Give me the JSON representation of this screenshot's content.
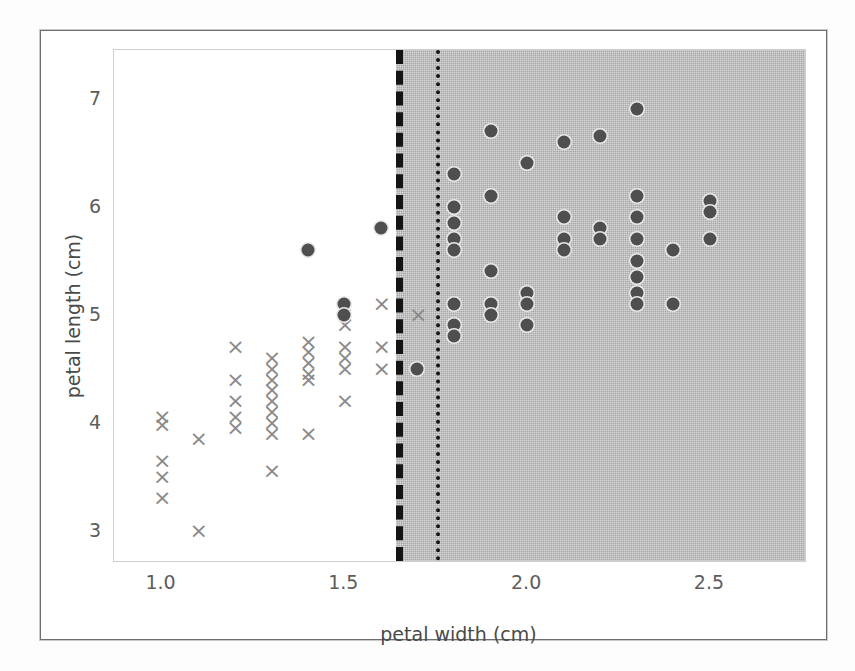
{
  "figure": {
    "xlabel": "petal width (cm)",
    "ylabel": "petal length (cm)",
    "xticks": [
      "1.0",
      "1.5",
      "2.0",
      "2.5"
    ],
    "yticks": [
      "3",
      "4",
      "5",
      "6",
      "7"
    ]
  },
  "colors": {
    "shade_region": "#a6a6a6",
    "circle_marker": "#4f4f4f",
    "x_marker": "#8a8a8a",
    "boundary_line": "#141414",
    "axes_border": "#cfcfcf",
    "tick_label": "#5d5d5d",
    "axis_label": "#4a4a4a",
    "page_background": "#ffffff"
  },
  "chart_data": {
    "type": "scatter",
    "title": "",
    "xlabel": "petal width (cm)",
    "ylabel": "petal length (cm)",
    "xlim": [
      0.87,
      2.76
    ],
    "ylim": [
      2.72,
      7.45
    ],
    "xticks": [
      1.0,
      1.5,
      2.0,
      2.5
    ],
    "yticks": [
      3,
      4,
      5,
      6,
      7
    ],
    "grid": false,
    "legend": "none",
    "decision_regions": [
      {
        "name": "left-region",
        "x_from": 0.87,
        "x_to": 1.64,
        "fill": "#ffffff"
      },
      {
        "name": "right-region",
        "x_from": 1.64,
        "x_to": 2.76,
        "fill": "#a6a6a6"
      }
    ],
    "boundaries": [
      {
        "name": "dashed-boundary",
        "x": 1.64,
        "style": "dashed",
        "width": 7
      },
      {
        "name": "dotted-boundary",
        "x": 1.75,
        "style": "dotted",
        "width": 4
      }
    ],
    "series": [
      {
        "name": "versicolor",
        "marker": "x",
        "color": "#8a8a8a",
        "points": [
          [
            1.0,
            4.05
          ],
          [
            1.0,
            3.98
          ],
          [
            1.0,
            3.65
          ],
          [
            1.0,
            3.5
          ],
          [
            1.0,
            3.3
          ],
          [
            1.1,
            3.85
          ],
          [
            1.1,
            3.0
          ],
          [
            1.2,
            4.7
          ],
          [
            1.2,
            4.4
          ],
          [
            1.2,
            4.2
          ],
          [
            1.2,
            4.05
          ],
          [
            1.2,
            3.95
          ],
          [
            1.3,
            4.6
          ],
          [
            1.3,
            4.5
          ],
          [
            1.3,
            4.4
          ],
          [
            1.3,
            4.3
          ],
          [
            1.3,
            4.2
          ],
          [
            1.3,
            4.1
          ],
          [
            1.3,
            4.0
          ],
          [
            1.3,
            3.9
          ],
          [
            1.3,
            3.55
          ],
          [
            1.4,
            4.75
          ],
          [
            1.4,
            4.65
          ],
          [
            1.4,
            4.55
          ],
          [
            1.4,
            4.45
          ],
          [
            1.4,
            4.4
          ],
          [
            1.4,
            3.9
          ],
          [
            1.5,
            5.0
          ],
          [
            1.5,
            4.9
          ],
          [
            1.5,
            4.7
          ],
          [
            1.5,
            4.6
          ],
          [
            1.5,
            4.5
          ],
          [
            1.5,
            4.2
          ],
          [
            1.6,
            5.1
          ],
          [
            1.6,
            4.7
          ],
          [
            1.6,
            4.5
          ],
          [
            1.7,
            5.0
          ]
        ]
      },
      {
        "name": "virginica",
        "marker": "o",
        "color": "#4f4f4f",
        "points": [
          [
            1.4,
            5.6
          ],
          [
            1.5,
            5.1
          ],
          [
            1.5,
            5.0
          ],
          [
            1.6,
            5.8
          ],
          [
            1.7,
            4.5
          ],
          [
            1.8,
            6.3
          ],
          [
            1.8,
            6.0
          ],
          [
            1.8,
            5.85
          ],
          [
            1.8,
            5.7
          ],
          [
            1.8,
            5.6
          ],
          [
            1.8,
            5.1
          ],
          [
            1.8,
            4.9
          ],
          [
            1.8,
            4.8
          ],
          [
            1.9,
            6.7
          ],
          [
            1.9,
            6.1
          ],
          [
            1.9,
            5.4
          ],
          [
            1.9,
            5.1
          ],
          [
            1.9,
            5.0
          ],
          [
            2.0,
            6.4
          ],
          [
            2.0,
            5.2
          ],
          [
            2.0,
            5.1
          ],
          [
            2.0,
            4.9
          ],
          [
            2.1,
            6.6
          ],
          [
            2.1,
            5.9
          ],
          [
            2.1,
            5.7
          ],
          [
            2.1,
            5.6
          ],
          [
            2.2,
            6.65
          ],
          [
            2.2,
            5.8
          ],
          [
            2.2,
            5.7
          ],
          [
            2.3,
            6.9
          ],
          [
            2.3,
            6.1
          ],
          [
            2.3,
            5.9
          ],
          [
            2.3,
            5.7
          ],
          [
            2.3,
            5.5
          ],
          [
            2.3,
            5.35
          ],
          [
            2.3,
            5.2
          ],
          [
            2.3,
            5.1
          ],
          [
            2.4,
            5.6
          ],
          [
            2.4,
            5.1
          ],
          [
            2.5,
            6.05
          ],
          [
            2.5,
            5.95
          ],
          [
            2.5,
            5.7
          ]
        ]
      }
    ]
  }
}
